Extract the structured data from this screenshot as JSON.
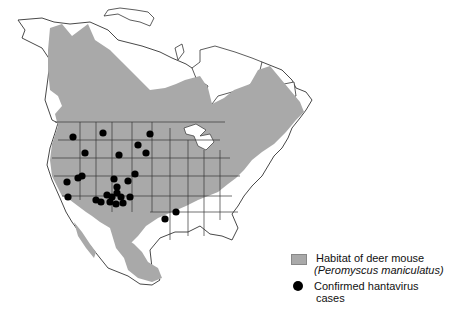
{
  "map": {
    "region": "North America",
    "colors": {
      "habitat": "#a9a9a9",
      "land": "#ffffff",
      "outline": "#333333",
      "cases": "#000000"
    }
  },
  "legend": {
    "habitat_label": "Habitat of deer mouse",
    "habitat_species": "(Peromyscus maniculatus)",
    "cases_label_line1": "Confirmed hantavirus",
    "cases_label_line2": "cases"
  },
  "cases": [
    {
      "x": 73,
      "y": 137
    },
    {
      "x": 103,
      "y": 133
    },
    {
      "x": 150,
      "y": 134
    },
    {
      "x": 138,
      "y": 145
    },
    {
      "x": 146,
      "y": 153
    },
    {
      "x": 85,
      "y": 153
    },
    {
      "x": 119,
      "y": 155
    },
    {
      "x": 82,
      "y": 176
    },
    {
      "x": 78,
      "y": 178
    },
    {
      "x": 67,
      "y": 182
    },
    {
      "x": 68,
      "y": 197
    },
    {
      "x": 135,
      "y": 174
    },
    {
      "x": 128,
      "y": 181
    },
    {
      "x": 114,
      "y": 179
    },
    {
      "x": 117,
      "y": 187
    },
    {
      "x": 107,
      "y": 195
    },
    {
      "x": 112,
      "y": 197
    },
    {
      "x": 117,
      "y": 193
    },
    {
      "x": 121,
      "y": 197
    },
    {
      "x": 110,
      "y": 202
    },
    {
      "x": 116,
      "y": 204
    },
    {
      "x": 123,
      "y": 203
    },
    {
      "x": 101,
      "y": 202
    },
    {
      "x": 96,
      "y": 200
    },
    {
      "x": 130,
      "y": 197
    },
    {
      "x": 165,
      "y": 219
    },
    {
      "x": 176,
      "y": 212
    }
  ]
}
